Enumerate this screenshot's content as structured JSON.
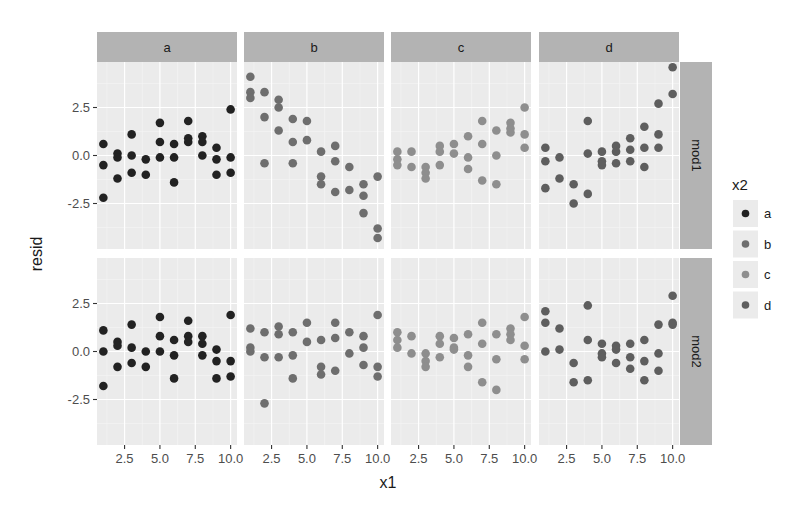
{
  "chart_data": {
    "type": "scatter",
    "title": "",
    "xlabel": "x1",
    "ylabel": "resid",
    "facet_cols": [
      "a",
      "b",
      "c",
      "d"
    ],
    "facet_rows": [
      "mod1",
      "mod2"
    ],
    "xlim": [
      0.55,
      10.45
    ],
    "ylim": [
      -4.87,
      4.87
    ],
    "x_ticks": [
      2.5,
      5.0,
      7.5,
      10.0
    ],
    "x_tick_labels": [
      "2.5",
      "5.0",
      "7.5",
      "10.0"
    ],
    "y_ticks": [
      2.5,
      0.0,
      -2.5
    ],
    "y_tick_labels": [
      "2.5",
      "0.0",
      "-2.5"
    ],
    "grid": true,
    "legend": {
      "title": "x2",
      "position": "right",
      "entries": [
        {
          "label": "a",
          "color": "#222222"
        },
        {
          "label": "b",
          "color": "#6e6e6e"
        },
        {
          "label": "c",
          "color": "#8e8e8e"
        },
        {
          "label": "d",
          "color": "#5e5e5e"
        }
      ]
    },
    "panels": {
      "mod1": {
        "a": [
          [
            1,
            0.6
          ],
          [
            1,
            -0.5
          ],
          [
            1,
            -2.2
          ],
          [
            2,
            0.1
          ],
          [
            2,
            -0.1
          ],
          [
            2,
            -1.2
          ],
          [
            3,
            1.1
          ],
          [
            3,
            0.0
          ],
          [
            3,
            -0.9
          ],
          [
            4,
            -0.2
          ],
          [
            4,
            -1.0
          ],
          [
            5,
            1.7
          ],
          [
            5,
            0.7
          ],
          [
            5,
            -0.1
          ],
          [
            6,
            0.6
          ],
          [
            6,
            -0.1
          ],
          [
            6,
            -1.4
          ],
          [
            7,
            1.8
          ],
          [
            7,
            0.9
          ],
          [
            7,
            0.7
          ],
          [
            8,
            1.0
          ],
          [
            8,
            0.7
          ],
          [
            8,
            0.0
          ],
          [
            9,
            0.4
          ],
          [
            9,
            -0.2
          ],
          [
            9,
            -1.0
          ],
          [
            10,
            2.4
          ],
          [
            10,
            -0.1
          ],
          [
            10,
            -0.9
          ]
        ],
        "b": [
          [
            1,
            4.1
          ],
          [
            1,
            3.3
          ],
          [
            1,
            3.0
          ],
          [
            2,
            3.3
          ],
          [
            2,
            2.0
          ],
          [
            2,
            -0.4
          ],
          [
            3,
            2.9
          ],
          [
            3,
            2.5
          ],
          [
            3,
            1.3
          ],
          [
            4,
            1.9
          ],
          [
            4,
            0.7
          ],
          [
            4,
            -0.4
          ],
          [
            5,
            1.8
          ],
          [
            5,
            0.8
          ],
          [
            6,
            0.2
          ],
          [
            6,
            -1.1
          ],
          [
            6,
            -1.5
          ],
          [
            7,
            0.5
          ],
          [
            7,
            -0.3
          ],
          [
            7,
            -1.9
          ],
          [
            8,
            -0.6
          ],
          [
            8,
            -1.8
          ],
          [
            9,
            -1.5
          ],
          [
            9,
            -2.1
          ],
          [
            9,
            -3.0
          ],
          [
            10,
            -1.1
          ],
          [
            10,
            -3.8
          ],
          [
            10,
            -4.3
          ]
        ],
        "c": [
          [
            1,
            0.2
          ],
          [
            1,
            -0.2
          ],
          [
            1,
            -0.5
          ],
          [
            2,
            0.2
          ],
          [
            2,
            -0.6
          ],
          [
            3,
            -0.6
          ],
          [
            3,
            -0.9
          ],
          [
            3,
            -1.2
          ],
          [
            4,
            0.5
          ],
          [
            4,
            0.2
          ],
          [
            4,
            -0.5
          ],
          [
            5,
            0.6
          ],
          [
            5,
            0.1
          ],
          [
            6,
            1.0
          ],
          [
            6,
            -0.1
          ],
          [
            6,
            -0.7
          ],
          [
            7,
            1.8
          ],
          [
            7,
            0.6
          ],
          [
            7,
            -1.3
          ],
          [
            8,
            1.3
          ],
          [
            8,
            0.0
          ],
          [
            8,
            -1.5
          ],
          [
            9,
            1.7
          ],
          [
            9,
            1.4
          ],
          [
            9,
            1.2
          ],
          [
            10,
            2.5
          ],
          [
            10,
            1.1
          ],
          [
            10,
            0.4
          ]
        ],
        "d": [
          [
            1,
            0.4
          ],
          [
            1,
            -0.3
          ],
          [
            1,
            -1.7
          ],
          [
            2,
            -0.1
          ],
          [
            2,
            -1.2
          ],
          [
            3,
            -1.5
          ],
          [
            3,
            -2.5
          ],
          [
            4,
            1.8
          ],
          [
            4,
            0.1
          ],
          [
            4,
            -2.0
          ],
          [
            5,
            0.2
          ],
          [
            5,
            -0.3
          ],
          [
            5,
            -0.5
          ],
          [
            6,
            0.5
          ],
          [
            6,
            0.2
          ],
          [
            6,
            -0.4
          ],
          [
            7,
            0.9
          ],
          [
            7,
            0.3
          ],
          [
            7,
            -0.3
          ],
          [
            8,
            1.5
          ],
          [
            8,
            0.4
          ],
          [
            8,
            -0.6
          ],
          [
            9,
            2.7
          ],
          [
            9,
            1.1
          ],
          [
            9,
            0.4
          ],
          [
            10,
            4.6
          ],
          [
            10,
            3.2
          ]
        ]
      },
      "mod2": {
        "a": [
          [
            1,
            1.1
          ],
          [
            1,
            0.0
          ],
          [
            1,
            -1.8
          ],
          [
            2,
            0.5
          ],
          [
            2,
            0.3
          ],
          [
            2,
            -0.8
          ],
          [
            3,
            1.4
          ],
          [
            3,
            0.2
          ],
          [
            3,
            -0.6
          ],
          [
            4,
            0.0
          ],
          [
            4,
            -0.8
          ],
          [
            5,
            1.8
          ],
          [
            5,
            0.8
          ],
          [
            5,
            0.0
          ],
          [
            6,
            0.6
          ],
          [
            6,
            -0.2
          ],
          [
            6,
            -1.4
          ],
          [
            7,
            1.6
          ],
          [
            7,
            0.8
          ],
          [
            7,
            0.5
          ],
          [
            8,
            0.8
          ],
          [
            8,
            0.4
          ],
          [
            8,
            -0.2
          ],
          [
            9,
            0.1
          ],
          [
            9,
            -0.5
          ],
          [
            9,
            -1.4
          ],
          [
            10,
            1.9
          ],
          [
            10,
            -0.5
          ],
          [
            10,
            -1.3
          ]
        ],
        "b": [
          [
            1,
            1.2
          ],
          [
            1,
            0.2
          ],
          [
            1,
            0.0
          ],
          [
            2,
            1.0
          ],
          [
            2,
            -0.3
          ],
          [
            2,
            -2.7
          ],
          [
            3,
            1.3
          ],
          [
            3,
            0.9
          ],
          [
            3,
            -0.3
          ],
          [
            4,
            1.0
          ],
          [
            4,
            -0.2
          ],
          [
            4,
            -1.4
          ],
          [
            5,
            1.5
          ],
          [
            5,
            0.5
          ],
          [
            6,
            0.6
          ],
          [
            6,
            -0.8
          ],
          [
            6,
            -1.2
          ],
          [
            7,
            1.5
          ],
          [
            7,
            0.7
          ],
          [
            7,
            -1.0
          ],
          [
            8,
            1.0
          ],
          [
            8,
            -0.1
          ],
          [
            9,
            0.8
          ],
          [
            9,
            0.2
          ],
          [
            9,
            -0.7
          ],
          [
            10,
            1.9
          ],
          [
            10,
            -0.8
          ],
          [
            10,
            -1.3
          ]
        ],
        "c": [
          [
            1,
            1.0
          ],
          [
            1,
            0.6
          ],
          [
            1,
            0.2
          ],
          [
            2,
            0.8
          ],
          [
            2,
            -0.1
          ],
          [
            3,
            -0.1
          ],
          [
            3,
            -0.5
          ],
          [
            3,
            -0.8
          ],
          [
            4,
            0.8
          ],
          [
            4,
            0.4
          ],
          [
            4,
            -0.3
          ],
          [
            5,
            0.7
          ],
          [
            5,
            0.2
          ],
          [
            5,
            0.1
          ],
          [
            6,
            0.9
          ],
          [
            6,
            -0.2
          ],
          [
            6,
            -0.8
          ],
          [
            7,
            1.5
          ],
          [
            7,
            0.4
          ],
          [
            7,
            -1.6
          ],
          [
            8,
            0.9
          ],
          [
            8,
            -0.4
          ],
          [
            8,
            -2.0
          ],
          [
            9,
            1.2
          ],
          [
            9,
            0.9
          ],
          [
            9,
            0.6
          ],
          [
            10,
            1.8
          ],
          [
            10,
            0.3
          ],
          [
            10,
            -0.4
          ]
        ],
        "d": [
          [
            1,
            2.1
          ],
          [
            1,
            1.5
          ],
          [
            1,
            0.0
          ],
          [
            2,
            1.2
          ],
          [
            2,
            0.1
          ],
          [
            3,
            -0.6
          ],
          [
            3,
            -1.6
          ],
          [
            4,
            2.4
          ],
          [
            4,
            0.6
          ],
          [
            4,
            -1.5
          ],
          [
            5,
            0.4
          ],
          [
            5,
            -0.1
          ],
          [
            5,
            -0.3
          ],
          [
            6,
            0.3
          ],
          [
            6,
            0.1
          ],
          [
            6,
            -0.6
          ],
          [
            7,
            0.4
          ],
          [
            7,
            -0.3
          ],
          [
            7,
            -0.9
          ],
          [
            8,
            0.6
          ],
          [
            8,
            -0.5
          ],
          [
            8,
            -1.5
          ],
          [
            9,
            1.4
          ],
          [
            9,
            -0.1
          ],
          [
            9,
            -1.0
          ],
          [
            10,
            2.9
          ],
          [
            10,
            1.5
          ],
          [
            10,
            1.4
          ]
        ]
      }
    }
  }
}
